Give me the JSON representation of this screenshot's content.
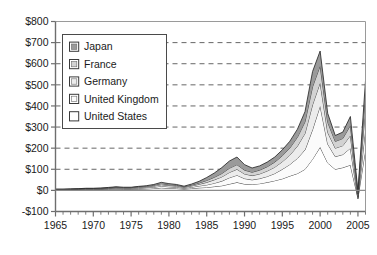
{
  "chart_data": {
    "type": "area",
    "stacked": true,
    "title": "",
    "subtitle": "",
    "xlabel": "",
    "ylabel": "",
    "xlim": [
      1965,
      2006
    ],
    "ylim": [
      -100,
      800
    ],
    "ytick_labels": [
      "$800",
      "$700",
      "$600",
      "$500",
      "$400",
      "$300",
      "$200",
      "$100",
      "$0",
      "-$100"
    ],
    "ytick_values": [
      800,
      700,
      600,
      500,
      400,
      300,
      200,
      100,
      0,
      -100
    ],
    "xtick_labels": [
      "1965",
      "1970",
      "1975",
      "1980",
      "1985",
      "1990",
      "1995",
      "2000",
      "2005"
    ],
    "xtick_values": [
      1965,
      1970,
      1975,
      1980,
      1985,
      1990,
      1995,
      2000,
      2005
    ],
    "x_minor_tick_interval": 1,
    "grid": "horizontal-dashed",
    "legend_position": "upper-left-inside",
    "x": [
      1965,
      1966,
      1967,
      1968,
      1969,
      1970,
      1971,
      1972,
      1973,
      1974,
      1975,
      1976,
      1977,
      1978,
      1979,
      1980,
      1981,
      1982,
      1983,
      1984,
      1985,
      1986,
      1987,
      1988,
      1989,
      1990,
      1991,
      1992,
      1993,
      1994,
      1995,
      1996,
      1997,
      1998,
      1999,
      2000,
      2001,
      2002,
      2003,
      2004,
      2005,
      2006
    ],
    "series": [
      {
        "name": "United States",
        "color": "#ffffff",
        "values": [
          2,
          2,
          3,
          3,
          4,
          4,
          4,
          5,
          6,
          5,
          5,
          6,
          7,
          9,
          12,
          10,
          9,
          6,
          9,
          12,
          14,
          18,
          22,
          30,
          38,
          30,
          28,
          32,
          38,
          46,
          55,
          68,
          80,
          100,
          148,
          205,
          130,
          100,
          108,
          120,
          -35,
          195
        ]
      },
      {
        "name": "United Kingdom",
        "color": "#fbfbfb",
        "values": [
          1,
          1,
          1,
          2,
          2,
          2,
          2,
          3,
          4,
          3,
          3,
          4,
          5,
          6,
          8,
          7,
          6,
          4,
          6,
          9,
          12,
          16,
          22,
          30,
          34,
          26,
          22,
          24,
          28,
          34,
          45,
          55,
          72,
          92,
          140,
          195,
          90,
          60,
          62,
          80,
          -5,
          100
        ]
      },
      {
        "name": "Germany",
        "color": "#ececec",
        "values": [
          1,
          1,
          1,
          1,
          2,
          2,
          2,
          2,
          3,
          3,
          3,
          4,
          4,
          5,
          7,
          6,
          5,
          4,
          6,
          8,
          12,
          16,
          20,
          25,
          28,
          22,
          20,
          22,
          26,
          30,
          36,
          44,
          58,
          78,
          118,
          110,
          55,
          40,
          42,
          60,
          10,
          95
        ]
      },
      {
        "name": "France",
        "color": "#d2d2d2",
        "values": [
          1,
          1,
          1,
          1,
          1,
          1,
          2,
          2,
          2,
          2,
          2,
          3,
          3,
          4,
          5,
          4,
          4,
          3,
          4,
          6,
          9,
          12,
          16,
          20,
          22,
          18,
          16,
          18,
          20,
          24,
          28,
          34,
          42,
          55,
          85,
          80,
          48,
          32,
          34,
          48,
          12,
          70
        ]
      },
      {
        "name": "Japan",
        "color": "#9a9a9a",
        "values": [
          1,
          1,
          1,
          1,
          1,
          1,
          1,
          2,
          2,
          2,
          2,
          2,
          3,
          4,
          6,
          5,
          4,
          3,
          5,
          8,
          14,
          20,
          28,
          34,
          36,
          26,
          20,
          20,
          22,
          24,
          28,
          32,
          38,
          48,
          72,
          70,
          42,
          28,
          30,
          42,
          14,
          60
        ]
      }
    ],
    "stack_order_bottom_to_top": [
      "United States",
      "United Kingdom",
      "Germany",
      "France",
      "Japan"
    ],
    "legend_order_top_to_bottom": [
      "Japan",
      "France",
      "Germany",
      "United Kingdom",
      "United States"
    ],
    "notes": {
      "peak_year": "1999",
      "peak_total": 663,
      "trough_year": "2005",
      "trough_total": -4
    }
  },
  "legend": {
    "entries": [
      {
        "label": "Japan",
        "color": "#9a9a9a"
      },
      {
        "label": "France",
        "color": "#d2d2d2"
      },
      {
        "label": "Germany",
        "color": "#ececec"
      },
      {
        "label": "United Kingdom",
        "color": "#fbfbfb"
      },
      {
        "label": "United States",
        "color": "#ffffff"
      }
    ]
  },
  "colors": {
    "axis": "#6e6e6e",
    "grid": "#555555",
    "series_line": "#2a2a2a",
    "text": "#1a1a1a",
    "background": "#ffffff"
  }
}
